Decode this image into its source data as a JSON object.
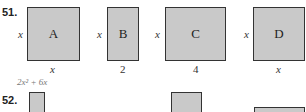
{
  "problems": [
    {
      "number": "51.",
      "figures": [
        {
          "label": "A",
          "side": "x",
          "bottom": "x"
        },
        {
          "label": "B",
          "side": "x",
          "bottom": "2"
        },
        {
          "label": "C",
          "side": "x",
          "bottom": "4"
        },
        {
          "label": "D",
          "side": "x",
          "bottom": "x"
        }
      ]
    },
    {
      "number": "52.",
      "expression": "2x² + 6x"
    }
  ]
}
